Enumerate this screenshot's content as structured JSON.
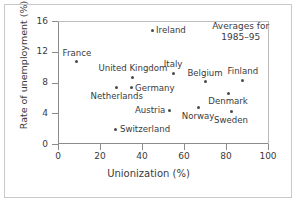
{
  "chart_data": {
    "type": "scatter",
    "title": "",
    "xlabel": "Unionization (%)",
    "ylabel": "Rate of unemployment (%)",
    "xlim": [
      0,
      100
    ],
    "ylim": [
      0,
      16
    ],
    "xticks": [
      "0",
      "20",
      "40",
      "60",
      "80",
      "100"
    ],
    "xtick_values": [
      0,
      20,
      40,
      60,
      80,
      100
    ],
    "yticks": [
      "0",
      "4",
      "8",
      "12",
      "16"
    ],
    "ytick_values": [
      0,
      4,
      8,
      12,
      16
    ],
    "grid": false,
    "legend": "none",
    "annotation": {
      "line1": "Averages for",
      "line2": "1985–95",
      "x": 87,
      "y": 15.2
    },
    "points": [
      {
        "label": "Ireland",
        "x": 44.8,
        "y": 14.8,
        "label_pos": "right"
      },
      {
        "label": "France",
        "x": 9.0,
        "y": 10.7,
        "label_pos": "top"
      },
      {
        "label": "Italy",
        "x": 54.8,
        "y": 9.2,
        "label_pos": "top"
      },
      {
        "label": "United Kingdom",
        "x": 35.7,
        "y": 8.7,
        "label_pos": "top"
      },
      {
        "label": "Belgium",
        "x": 70.0,
        "y": 8.1,
        "label_pos": "top"
      },
      {
        "label": "Finland",
        "x": 88.0,
        "y": 8.3,
        "label_pos": "top"
      },
      {
        "label": "Germany",
        "x": 34.8,
        "y": 7.3,
        "label_pos": "right"
      },
      {
        "label": "Netherlands",
        "x": 28.0,
        "y": 7.3,
        "label_pos": "bottom"
      },
      {
        "label": "Denmark",
        "x": 81.0,
        "y": 6.6,
        "label_pos": "bottom"
      },
      {
        "label": "Norway",
        "x": 66.7,
        "y": 4.7,
        "label_pos": "bottom"
      },
      {
        "label": "Austria",
        "x": 53.0,
        "y": 4.4,
        "label_pos": "left"
      },
      {
        "label": "Sweden",
        "x": 82.4,
        "y": 4.2,
        "label_pos": "bottom"
      },
      {
        "label": "Switzerland",
        "x": 27.6,
        "y": 1.9,
        "label_pos": "right"
      }
    ]
  },
  "colors": {
    "point": "#4a4a4a",
    "axis": "#8c8c8c",
    "frame": "#c9c9c9",
    "text": "#3a3a3a",
    "background": "#ffffff"
  }
}
